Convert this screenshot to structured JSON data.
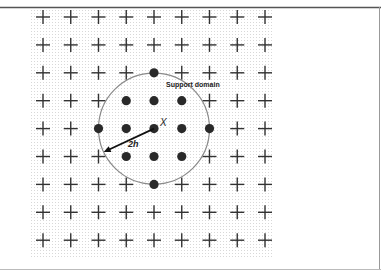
{
  "diagram": {
    "grid": {
      "columns": 9,
      "rows": 9,
      "origin_x": 43,
      "origin_y": 17,
      "dx": 27.75,
      "dy": 27.9
    },
    "center_node": {
      "col": 4,
      "row": 4,
      "label": "X"
    },
    "support_nodes": [
      {
        "col": 4,
        "row": 2
      },
      {
        "col": 3,
        "row": 3
      },
      {
        "col": 4,
        "row": 3
      },
      {
        "col": 5,
        "row": 3
      },
      {
        "col": 2,
        "row": 4
      },
      {
        "col": 3,
        "row": 4
      },
      {
        "col": 4,
        "row": 4
      },
      {
        "col": 5,
        "row": 4
      },
      {
        "col": 6,
        "row": 4
      },
      {
        "col": 3,
        "row": 5
      },
      {
        "col": 4,
        "row": 5
      },
      {
        "col": 5,
        "row": 5
      },
      {
        "col": 4,
        "row": 6
      }
    ],
    "support_circle": {
      "radius_in_cells": 2,
      "label": "Support domain"
    },
    "radius_arrow": {
      "label": "2h",
      "angle_deg": 205
    },
    "legend": {
      "field_node_symbol": "plus",
      "support_node_symbol": "filled-dot"
    },
    "colors": {
      "ink": "#333333",
      "dot": "#2a2a2a",
      "circle": "#888888",
      "texture": "#d4d4d4",
      "frame": "#555555"
    }
  }
}
